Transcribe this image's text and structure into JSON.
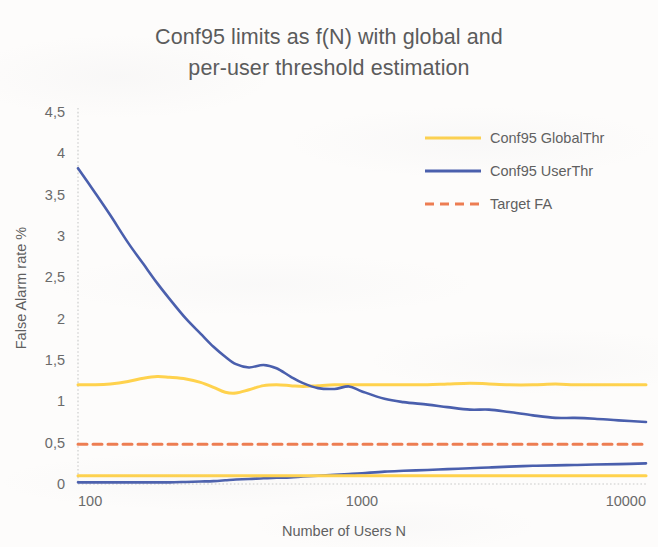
{
  "chart_data": {
    "type": "line",
    "title": "Conf95 limits as f(N) with global and per-user threshold estimation",
    "title_line1": "Conf95 limits as f(N) with global and",
    "title_line2": "per-user threshold estimation",
    "xlabel": "Number of Users N",
    "ylabel": "False Alarm rate %",
    "xscale": "log",
    "xlim": [
      100,
      10000
    ],
    "ylim": [
      0,
      4.5
    ],
    "grid": false,
    "legend_position": "top-right",
    "x_tick_labels": [
      "100",
      "1000",
      "10000"
    ],
    "x_tick_values": [
      100,
      1000,
      10000
    ],
    "y_tick_labels": [
      "0",
      "0,5",
      "1",
      "1,5",
      "2",
      "2,5",
      "3",
      "3,5",
      "4",
      "4,5"
    ],
    "y_tick_values": [
      0,
      0.5,
      1,
      1.5,
      2,
      2.5,
      3,
      3.5,
      4,
      4.5
    ],
    "colors": {
      "global_thr": "#FFD24D",
      "user_thr": "#4A5FAD",
      "target_fa": "#ED7D52",
      "axis": "#c9c9c9",
      "text": "#5f5f5f",
      "background": "#fdfcfb"
    },
    "series": [
      {
        "name": "Conf95 GlobalThr",
        "key": "global_upper",
        "color": "#FFD24D",
        "style": "solid",
        "width": 3.0,
        "legend": true,
        "x": [
          100,
          115,
          130,
          150,
          170,
          190,
          210,
          240,
          270,
          300,
          330,
          360,
          400,
          450,
          500,
          560,
          620,
          700,
          800,
          900,
          1000,
          1200,
          1400,
          1700,
          2000,
          2400,
          2800,
          3300,
          4000,
          4800,
          5600,
          6600,
          8000,
          10000
        ],
        "values": [
          1.2,
          1.2,
          1.21,
          1.24,
          1.28,
          1.3,
          1.29,
          1.27,
          1.23,
          1.17,
          1.11,
          1.1,
          1.14,
          1.19,
          1.2,
          1.19,
          1.18,
          1.19,
          1.2,
          1.2,
          1.2,
          1.2,
          1.2,
          1.2,
          1.21,
          1.22,
          1.21,
          1.2,
          1.2,
          1.21,
          1.2,
          1.2,
          1.2,
          1.2
        ]
      },
      {
        "name": "Conf95 UserThr",
        "key": "user_upper",
        "color": "#4A5FAD",
        "style": "solid",
        "width": 2.6,
        "legend": true,
        "x": [
          100,
          115,
          130,
          150,
          170,
          190,
          210,
          240,
          270,
          300,
          330,
          360,
          400,
          450,
          500,
          560,
          620,
          700,
          800,
          900,
          1000,
          1200,
          1400,
          1700,
          2000,
          2400,
          2800,
          3300,
          4000,
          4800,
          5600,
          6600,
          8000,
          10000
        ],
        "values": [
          3.82,
          3.52,
          3.25,
          2.92,
          2.66,
          2.43,
          2.24,
          2.0,
          1.82,
          1.66,
          1.54,
          1.45,
          1.41,
          1.44,
          1.4,
          1.3,
          1.22,
          1.16,
          1.15,
          1.18,
          1.12,
          1.03,
          0.99,
          0.96,
          0.93,
          0.9,
          0.9,
          0.87,
          0.83,
          0.8,
          0.8,
          0.79,
          0.77,
          0.75
        ]
      },
      {
        "name": "Target FA",
        "key": "target_fa",
        "color": "#ED7D52",
        "style": "dashed",
        "width": 3.0,
        "legend": true,
        "x": [
          100,
          10000
        ],
        "values": [
          0.48,
          0.48
        ]
      },
      {
        "name": "Conf95 UserThr (lower)",
        "key": "user_lower",
        "color": "#4A5FAD",
        "style": "solid",
        "width": 2.6,
        "legend": false,
        "x": [
          100,
          115,
          130,
          150,
          170,
          190,
          210,
          240,
          270,
          300,
          330,
          360,
          400,
          450,
          500,
          560,
          620,
          700,
          800,
          900,
          1000,
          1200,
          1400,
          1700,
          2000,
          2400,
          2800,
          3300,
          4000,
          4800,
          5600,
          6600,
          8000,
          10000
        ],
        "values": [
          0.02,
          0.02,
          0.02,
          0.02,
          0.02,
          0.02,
          0.02,
          0.025,
          0.03,
          0.035,
          0.045,
          0.055,
          0.06,
          0.07,
          0.075,
          0.08,
          0.09,
          0.1,
          0.11,
          0.12,
          0.13,
          0.15,
          0.16,
          0.17,
          0.18,
          0.19,
          0.2,
          0.21,
          0.22,
          0.225,
          0.23,
          0.235,
          0.24,
          0.25
        ]
      },
      {
        "name": "Conf95 GlobalThr (lower)",
        "key": "global_lower",
        "color": "#FFD24D",
        "style": "solid",
        "width": 3.0,
        "legend": false,
        "x": [
          100,
          200,
          400,
          700,
          1000,
          2000,
          4000,
          7000,
          10000
        ],
        "values": [
          0.1,
          0.1,
          0.1,
          0.1,
          0.1,
          0.1,
          0.1,
          0.1,
          0.1
        ]
      }
    ],
    "legend_entries": [
      {
        "label": "Conf95 GlobalThr",
        "color": "#FFD24D",
        "style": "solid"
      },
      {
        "label": "Conf95 UserThr",
        "color": "#4A5FAD",
        "style": "solid"
      },
      {
        "label": "Target FA",
        "color": "#ED7D52",
        "style": "dashed"
      }
    ]
  }
}
